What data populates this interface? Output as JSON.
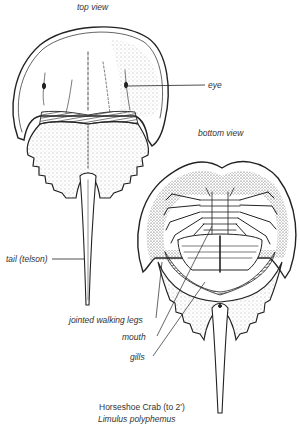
{
  "views": {
    "top": "top view",
    "bottom": "bottom view"
  },
  "labels": {
    "eye": "eye",
    "tail": "tail (telson)",
    "legs": "jointed walking legs",
    "mouth": "mouth",
    "gills": "gills"
  },
  "caption": {
    "common_name": "Horseshoe Crab (to 2')",
    "scientific_name": "Limulus polyphemus"
  },
  "colors": {
    "ink": "#222222",
    "text": "#333333",
    "background": "#ffffff"
  }
}
